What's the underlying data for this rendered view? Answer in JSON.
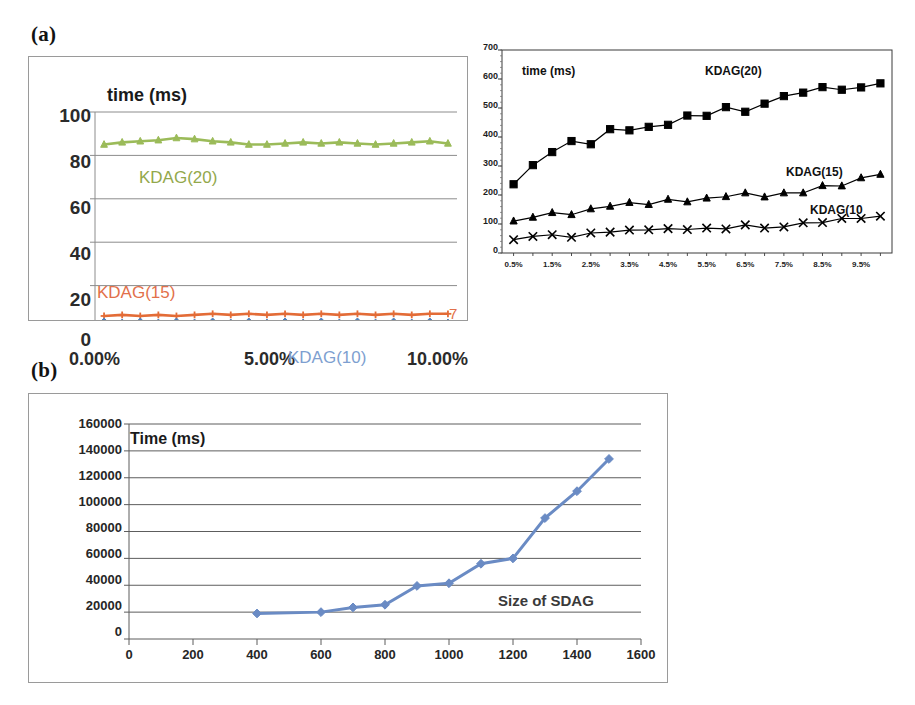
{
  "figure": {
    "panels": [
      {
        "id": "a",
        "label": "(a)"
      },
      {
        "id": "b",
        "label": "(b)"
      }
    ]
  },
  "chart_data": [
    {
      "id": "a-left",
      "type": "line",
      "title": "time (ms)",
      "xlabel": "",
      "ylabel": "",
      "grid": true,
      "legend_position": "inline-annotations",
      "ylim": [
        0,
        100
      ],
      "yticks": [
        0,
        20,
        40,
        60,
        80,
        100
      ],
      "yticklabels": [
        "0",
        "20",
        "40",
        "60",
        "80",
        "100"
      ],
      "xlim": [
        0,
        10
      ],
      "xticks": [
        0,
        5,
        10
      ],
      "xticklabels": [
        "0.00%",
        "5.00%",
        "10.00%"
      ],
      "annotations": [
        {
          "text": "time (ms)",
          "color": "#1a1a1a",
          "x": 0.55,
          "y": 96
        },
        {
          "text": "KDAG(20)",
          "color": "#93a84b",
          "x": 1.55,
          "y": 72
        },
        {
          "text": "KDAG(15)",
          "color": "#e2704a",
          "x": 0.5,
          "y": 17
        },
        {
          "text": "KDAG(10)",
          "color": "#7e9fd0",
          "x": 6.6,
          "y": -10
        },
        {
          "text": "7",
          "color": "#e2704a",
          "x": 10.15,
          "y": 7
        }
      ],
      "x": [
        0.25,
        0.75,
        1.25,
        1.75,
        2.25,
        2.75,
        3.25,
        3.75,
        4.25,
        4.75,
        5.25,
        5.75,
        6.25,
        6.75,
        7.25,
        7.75,
        8.25,
        8.75,
        9.25,
        9.75
      ],
      "series": [
        {
          "name": "KDAG(20)",
          "color": "#9bbb59",
          "marker": "triangle",
          "values": [
            85,
            86,
            86.5,
            87,
            88,
            87.5,
            86.5,
            86,
            85,
            85,
            85.5,
            86,
            85.5,
            86,
            85.5,
            85,
            85.5,
            86,
            86.5,
            85.5
          ]
        },
        {
          "name": "KDAG(15)",
          "color": "#e36c37",
          "marker": "plus",
          "values": [
            6,
            6.5,
            6,
            6.5,
            6,
            6.5,
            7,
            6.5,
            7,
            6.5,
            7,
            6.5,
            7,
            6.5,
            7,
            6.5,
            7,
            6.5,
            7,
            7
          ]
        },
        {
          "name": "KDAG(10)",
          "color": "#4f81bd",
          "marker": "diamond",
          "values": [
            3.5,
            3,
            3.5,
            3,
            3.5,
            3,
            3.5,
            3,
            3.5,
            3,
            3.5,
            3,
            3.5,
            3,
            3.5,
            3,
            3.5,
            3,
            3.5,
            3
          ]
        }
      ]
    },
    {
      "id": "a-right",
      "type": "line",
      "title": "time (ms)",
      "xlabel": "",
      "ylabel": "",
      "grid": false,
      "legend_position": "inline-annotations",
      "ylim": [
        0,
        700
      ],
      "yticks": [
        0,
        100,
        200,
        300,
        400,
        500,
        600,
        700
      ],
      "yticklabels": [
        "0",
        "100",
        "200",
        "300",
        "400",
        "500",
        "600",
        "700"
      ],
      "xticklabels": [
        "0.5%",
        "1.5%",
        "2.5%",
        "3.5%",
        "4.5%",
        "5.5%",
        "6.5%",
        "7.5%",
        "8.5%",
        "9.5%"
      ],
      "annotations": [
        {
          "text": "time (ms)",
          "x": 1,
          "y": 620
        },
        {
          "text": "KDAG(20)",
          "x": 10,
          "y": 630
        },
        {
          "text": "KDAG(15)",
          "x": 15.5,
          "y": 310
        },
        {
          "text": "KDAG(10",
          "x": 16.5,
          "y": 180
        }
      ],
      "x": [
        1,
        2,
        3,
        4,
        5,
        6,
        7,
        8,
        9,
        10,
        11,
        12,
        13,
        14,
        15,
        16,
        17,
        18,
        19,
        20
      ],
      "series": [
        {
          "name": "KDAG(20)",
          "color": "#000000",
          "marker": "square",
          "values": [
            237,
            303,
            348,
            386,
            375,
            427,
            423,
            435,
            442,
            474,
            473,
            503,
            487,
            515,
            541,
            553,
            572,
            563,
            571,
            585
          ]
        },
        {
          "name": "KDAG(15)",
          "color": "#000000",
          "marker": "triangle",
          "values": [
            110,
            123,
            139,
            132,
            152,
            161,
            174,
            167,
            185,
            176,
            189,
            194,
            207,
            193,
            207,
            207,
            232,
            231,
            259,
            271
          ]
        },
        {
          "name": "KDAG(10)",
          "color": "#000000",
          "marker": "x",
          "values": [
            46,
            57,
            63,
            54,
            69,
            72,
            79,
            80,
            84,
            81,
            86,
            83,
            97,
            86,
            90,
            104,
            105,
            119,
            119,
            127
          ]
        }
      ]
    },
    {
      "id": "b",
      "type": "line",
      "title": "Time (ms)",
      "xlabel": "Size of SDAG",
      "ylabel": "",
      "grid": true,
      "legend_position": "inline-annotations",
      "ylim": [
        0,
        160000
      ],
      "yticks": [
        0,
        20000,
        40000,
        60000,
        80000,
        100000,
        120000,
        140000,
        160000
      ],
      "yticklabels": [
        "0",
        "20000",
        "40000",
        "60000",
        "80000",
        "100000",
        "120000",
        "140000",
        "160000"
      ],
      "xlim": [
        0,
        1600
      ],
      "xticks": [
        0,
        200,
        400,
        600,
        800,
        1000,
        1200,
        1400,
        1600
      ],
      "xticklabels": [
        "0",
        "200",
        "400",
        "600",
        "800",
        "1000",
        "1200",
        "1400",
        "1600"
      ],
      "annotations": [
        {
          "text": "Time (ms)",
          "x": 90,
          "y": 143000
        },
        {
          "text": "Size of SDAG",
          "x": 1010,
          "y": 18000
        }
      ],
      "series": [
        {
          "name": "Time (ms)",
          "color": "#6a8bc4",
          "marker": "diamond",
          "x": [
            400,
            600,
            700,
            800,
            900,
            1000,
            1100,
            1200,
            1300,
            1400,
            1500
          ],
          "values": [
            19000,
            20000,
            23500,
            25500,
            39500,
            41500,
            56000,
            60000,
            90000,
            110000,
            134000
          ]
        }
      ]
    }
  ]
}
